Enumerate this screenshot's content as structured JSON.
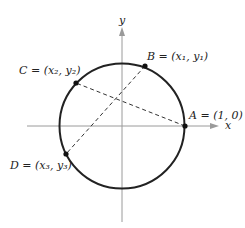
{
  "diagram": {
    "type": "unit-circle-chords",
    "axes": {
      "x_label": "x",
      "y_label": "y"
    },
    "circle": {
      "cx": 122,
      "cy": 126,
      "r": 62,
      "stroke": "#222222"
    },
    "points": [
      {
        "id": "A",
        "label": "A = (1, 0)",
        "x": 185,
        "y": 126
      },
      {
        "id": "B",
        "label": "B = (x₁, y₁)",
        "x": 145,
        "y": 66
      },
      {
        "id": "C",
        "label": "C = (x₂, y₂)",
        "x": 76,
        "y": 83
      },
      {
        "id": "D",
        "label": "D = (x₃, y₃)",
        "x": 66,
        "y": 154
      }
    ],
    "chords": [
      {
        "from": "A",
        "to": "C",
        "style": "dashed"
      },
      {
        "from": "B",
        "to": "D",
        "style": "dashed"
      }
    ]
  }
}
